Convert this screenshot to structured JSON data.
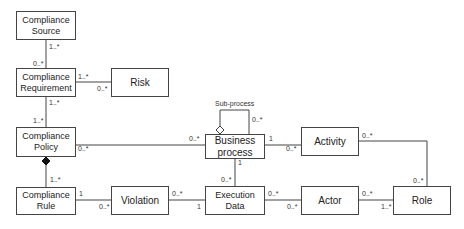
{
  "diagram": {
    "type": "UML class diagram",
    "classes": {
      "compliance_source": "Compliance Source",
      "compliance_requirement": "Compliance Requirement",
      "risk": "Risk",
      "compliance_policy": "Compliance Policy",
      "compliance_rule": "Compliance Rule",
      "violation": "Violation",
      "business_process": "Business process",
      "execution_data": "Execution Data",
      "activity": "Activity",
      "actor": "Actor",
      "role": "Role"
    },
    "labels": {
      "sub_process": "Sub-process",
      "src_req_top": "1..*",
      "src_req_bottom": "0..*",
      "req_risk_left": "1..*",
      "req_risk_right": "0..*",
      "req_pol_top": "1..*",
      "req_pol_bottom": "1..*",
      "pol_bp_left": "0..*",
      "pol_bp_right": "0..*",
      "pol_rule_bottom": "1..*",
      "rule_viol_left": "1",
      "rule_viol_right": "0..*",
      "viol_exec_left": "0..*",
      "viol_exec_right": "1",
      "bp_sub_top": "0..*",
      "bp_act_left": "1",
      "bp_act_right": "0..*",
      "bp_exec_top": "1",
      "bp_exec_bottom": "0..*",
      "exec_actor_left": "0..*",
      "exec_actor_right": "0..*",
      "act_role_top": "0..*",
      "act_role_bottom": "0..*",
      "actor_role_left": "0..*",
      "actor_role_right": "1..*"
    },
    "relationships": [
      {
        "from": "Compliance Source",
        "to": "Compliance Requirement",
        "type": "association"
      },
      {
        "from": "Compliance Requirement",
        "to": "Risk",
        "type": "association"
      },
      {
        "from": "Compliance Requirement",
        "to": "Compliance Policy",
        "type": "association"
      },
      {
        "from": "Compliance Policy",
        "to": "Business process",
        "type": "association"
      },
      {
        "from": "Compliance Policy",
        "to": "Compliance Rule",
        "type": "composition"
      },
      {
        "from": "Compliance Rule",
        "to": "Violation",
        "type": "association"
      },
      {
        "from": "Violation",
        "to": "Execution Data",
        "type": "association"
      },
      {
        "from": "Business process",
        "to": "Business process",
        "type": "aggregation",
        "label": "Sub-process"
      },
      {
        "from": "Business process",
        "to": "Activity",
        "type": "association"
      },
      {
        "from": "Business process",
        "to": "Execution Data",
        "type": "association"
      },
      {
        "from": "Execution Data",
        "to": "Actor",
        "type": "association"
      },
      {
        "from": "Activity",
        "to": "Role",
        "type": "association"
      },
      {
        "from": "Actor",
        "to": "Role",
        "type": "association"
      }
    ]
  }
}
